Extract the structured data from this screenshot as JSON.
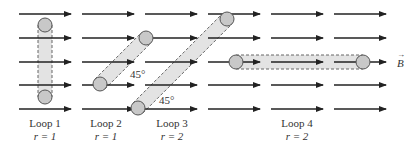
{
  "field": {
    "label": "B",
    "vector_mark": "→",
    "rows_y": [
      14,
      38,
      62,
      85,
      109
    ],
    "columns": [
      [
        19,
        71
      ],
      [
        82,
        134
      ],
      [
        145,
        197
      ],
      [
        208,
        260
      ],
      [
        271,
        323
      ],
      [
        334,
        386
      ]
    ]
  },
  "loops": [
    {
      "name": "Loop 1",
      "r_label": "r = 1",
      "p1": [
        45,
        25
      ],
      "p2": [
        45,
        97
      ],
      "label_x": 45
    },
    {
      "name": "Loop 2",
      "r_label": "r = 1",
      "p1": [
        100,
        84
      ],
      "p2": [
        146,
        38
      ],
      "angle_label": "45°",
      "angle_pos": [
        130,
        78
      ],
      "label_x": 106
    },
    {
      "name": "Loop 3",
      "r_label": "r = 2",
      "p1": [
        138,
        108
      ],
      "p2": [
        227,
        19
      ],
      "angle_label": "45°",
      "angle_pos": [
        159,
        104
      ],
      "label_x": 172
    },
    {
      "name": "Loop 4",
      "r_label": "r = 2",
      "p1": [
        236,
        62
      ],
      "p2": [
        363,
        62
      ],
      "label_x": 297
    }
  ],
  "colors": {
    "arrow": "#222222",
    "band_fill": "#e3e3e3",
    "band_stroke": "#666666",
    "circle_fill": "#c8c8c8",
    "circle_stroke": "#555555"
  }
}
